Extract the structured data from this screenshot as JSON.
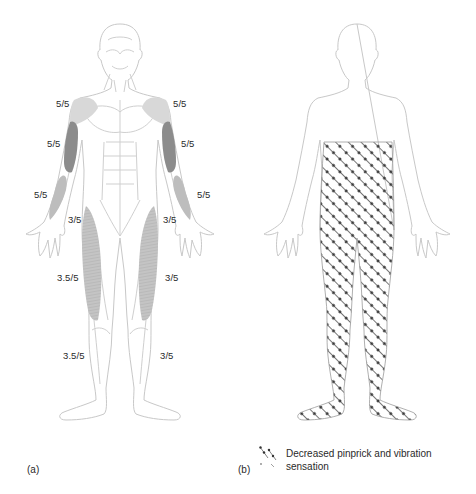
{
  "figure": {
    "panel_a": {
      "label": "(a)",
      "grades": {
        "right_shoulder": "5/5",
        "left_shoulder": "5/5",
        "right_upper_arm": "5/5",
        "left_upper_arm": "5/5",
        "right_forearm": "5/5",
        "left_forearm": "5/5",
        "right_hip": "3/5",
        "left_hip": "3/5",
        "right_thigh": "3.5/5",
        "left_thigh": "3/5",
        "right_lower_leg": "3.5/5",
        "left_lower_leg": "3/5"
      }
    },
    "panel_b": {
      "label": "(b)",
      "legend": {
        "icon": "dotted-hatch-pattern-icon",
        "text": "Decreased pinprick and vibration sensation"
      }
    },
    "colors": {
      "outline": "#c8c8c8",
      "muscle_dark": "#8a8a8a",
      "muscle_mid": "#b4b4b4",
      "muscle_light": "#d6d6d6",
      "hatch": "#555555",
      "text": "#2a2a2a"
    }
  }
}
